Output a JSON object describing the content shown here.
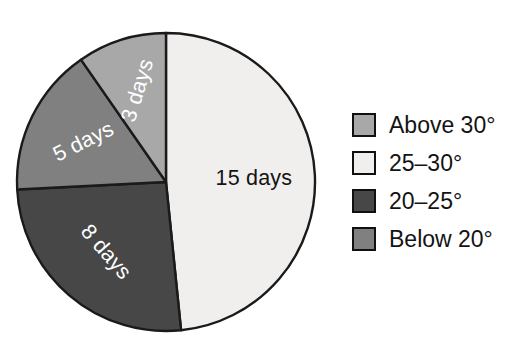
{
  "chart_data": {
    "type": "pie",
    "title": "",
    "subtitle": "",
    "xlabel": "",
    "ylabel": "",
    "unit": "days",
    "total": 31,
    "legend_position": "right",
    "grid": false,
    "start_angle_deg": 0,
    "direction": "clockwise",
    "categories": [
      "25–30°",
      "20–25°",
      "Below 20°",
      "Above 30°"
    ],
    "values": [
      15,
      8,
      5,
      3
    ],
    "slices": [
      {
        "key": "t25_30",
        "legend_label": "25–30°",
        "data_label": "15 days",
        "value": 15,
        "color": "#f0efed",
        "text_color": "#141414",
        "start_deg": 0,
        "end_deg": 174.2,
        "label_angle_deg": 87.1,
        "label_radius": 88,
        "label_rotation_deg": 0
      },
      {
        "key": "t20_25",
        "legend_label": "20–25°",
        "data_label": "8 days",
        "value": 8,
        "color": "#474747",
        "text_color": "#ffffff",
        "start_deg": 174.2,
        "end_deg": 267.1,
        "label_angle_deg": 220.6,
        "label_radius": 92,
        "label_rotation_deg": 49
      },
      {
        "key": "below20",
        "legend_label": "Below 20°",
        "data_label": "5 days",
        "value": 5,
        "color": "#808080",
        "text_color": "#ffffff",
        "start_deg": 267.1,
        "end_deg": 325.2,
        "label_angle_deg": 296.1,
        "label_radius": 92,
        "label_rotation_deg": -26
      },
      {
        "key": "above30",
        "legend_label": "Above 30°",
        "data_label": "3 days",
        "value": 3,
        "color": "#a8a8a8",
        "text_color": "#ffffff",
        "start_deg": 325.2,
        "end_deg": 360,
        "label_angle_deg": 342.6,
        "label_radius": 96,
        "label_rotation_deg": -73
      }
    ],
    "geometry": {
      "center_x": 166,
      "center_y": 182,
      "radius": 149,
      "outline_color": "#1a1a1a",
      "outline_width": 2.4
    }
  },
  "legend": {
    "items": [
      {
        "label": "Above 30°",
        "color": "#a8a8a8"
      },
      {
        "label": "25–30°",
        "color": "#f0efed"
      },
      {
        "label": "20–25°",
        "color": "#474747"
      },
      {
        "label": "Below 20°",
        "color": "#808080"
      }
    ]
  },
  "slice_labels": {
    "s0": "15 days",
    "s1": "8 days",
    "s2": "5 days",
    "s3": "3 days"
  }
}
